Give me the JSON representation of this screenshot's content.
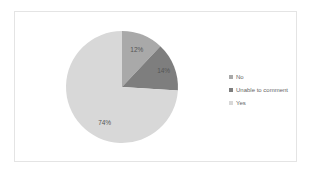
{
  "chart_data": {
    "type": "pie",
    "title": "",
    "categories": [
      "No",
      "Unable to comment",
      "Yes"
    ],
    "values": [
      12,
      14,
      74
    ],
    "labels": [
      "12%",
      "14%",
      "74%"
    ],
    "colors": [
      "#a9a9a9",
      "#7e7e7e",
      "#d8d8d8"
    ],
    "legend_position": "right",
    "start_angle": "top, clockwise"
  },
  "legend": {
    "items": [
      {
        "label": "No",
        "color": "#a9a9a9"
      },
      {
        "label": "Unable to comment",
        "color": "#7e7e7e"
      },
      {
        "label": "Yes",
        "color": "#d8d8d8"
      }
    ]
  }
}
